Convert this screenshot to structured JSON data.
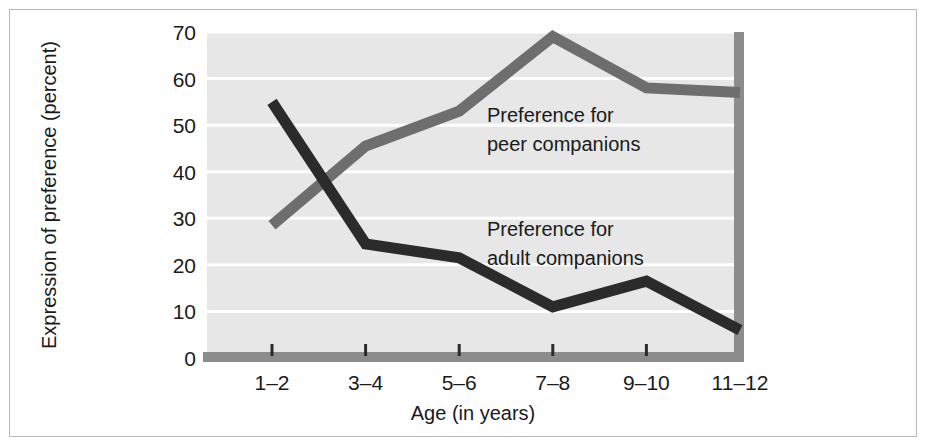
{
  "figure": {
    "border_color": "#b9b9b9",
    "background": "#ffffff"
  },
  "chart_data": {
    "type": "line",
    "title": "",
    "subtitle": "",
    "xlabel": "Age (in years)",
    "ylabel": "Expression of preference (percent)",
    "categories": [
      "1–2",
      "3–4",
      "5–6",
      "7–8",
      "9–10",
      "11–12"
    ],
    "x_tick_labels": [
      "1–2",
      "3–4",
      "5–6",
      "7–8",
      "9–10",
      "11–12"
    ],
    "y_tick_labels": [
      "0",
      "10",
      "20",
      "30",
      "40",
      "50",
      "60",
      "70"
    ],
    "y_ticks": [
      0,
      10,
      20,
      30,
      40,
      50,
      60,
      70
    ],
    "ylim": [
      0,
      70
    ],
    "grid": "horizontal",
    "legend_position": "inline-annotations",
    "plot_background": "#e7e7e7",
    "gridline_color": "#ffffff",
    "axis_bar_color": "#8c8c8c",
    "series": [
      {
        "name": "Preference for peer companions",
        "color": "#6e6e6e",
        "values": [
          28.5,
          45.5,
          53.0,
          69.0,
          58.0,
          57.0
        ],
        "annotation": {
          "line1": "Preference for",
          "line2": "peer companions"
        }
      },
      {
        "name": "Preference for adult companions",
        "color": "#2b2b2b",
        "values": [
          55.0,
          24.5,
          21.5,
          11.0,
          16.5,
          6.0
        ],
        "annotation": {
          "line1": "Preference for",
          "line2": "adult companions"
        }
      }
    ]
  }
}
